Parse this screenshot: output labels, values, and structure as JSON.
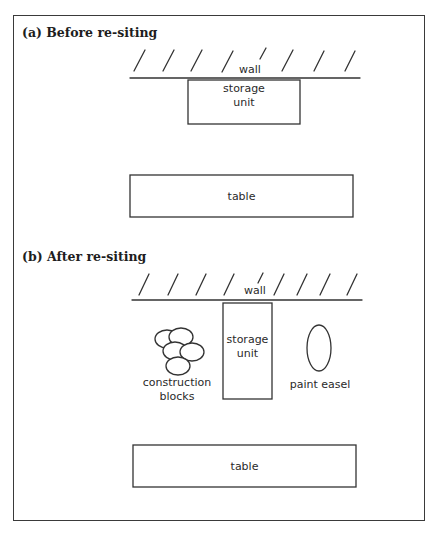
{
  "figure": {
    "panels": [
      {
        "id": "a",
        "heading": "(a) Before re-siting",
        "wall_label": "wall",
        "storage_unit_label_line1": "storage",
        "storage_unit_label_line2": "unit",
        "table_label": "table"
      },
      {
        "id": "b",
        "heading": "(b) After re-siting",
        "wall_label": "wall",
        "storage_unit_label_line1": "storage",
        "storage_unit_label_line2": "unit",
        "blocks_label_line1": "construction",
        "blocks_label_line2": "blocks",
        "easel_label": "paint easel",
        "table_label": "table"
      }
    ],
    "colors": {
      "line": "#333333",
      "background": "#ffffff"
    }
  }
}
